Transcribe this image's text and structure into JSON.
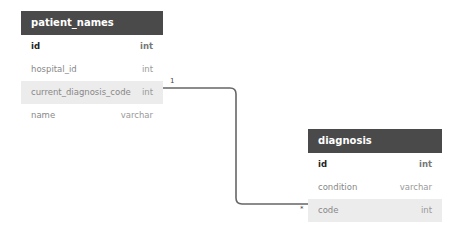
{
  "tables": [
    {
      "name": "patient_names",
      "columns": [
        {
          "name": "id",
          "type": "int",
          "pk": true
        },
        {
          "name": "hospital_id",
          "type": "int"
        },
        {
          "name": "current_diagnosis_code",
          "type": "int",
          "highlighted": true
        },
        {
          "name": "name",
          "type": "varchar"
        }
      ]
    },
    {
      "name": "diagnosis",
      "columns": [
        {
          "name": "id",
          "type": "int",
          "pk": true
        },
        {
          "name": "condition",
          "type": "varchar"
        },
        {
          "name": "code",
          "type": "int",
          "highlighted": true
        }
      ]
    }
  ],
  "relationship": {
    "from": "patient_names.current_diagnosis_code",
    "to": "diagnosis.code",
    "from_cardinality": "1",
    "to_cardinality": "*",
    "line_color": "#666666"
  }
}
